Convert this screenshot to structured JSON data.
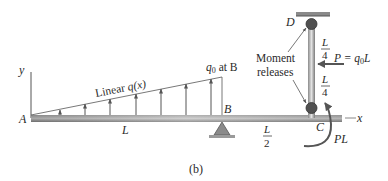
{
  "figure": {
    "caption": "(b)",
    "axes": {
      "y_label": "y",
      "x_label": "x"
    },
    "points": {
      "A": "A",
      "B": "B",
      "C": "C",
      "D": "D"
    },
    "load": {
      "label": "Linear q(x)",
      "label_prefix": "Linear ",
      "label_func": "q(x)",
      "max_label": "q",
      "max_sub": "0",
      "max_suffix": " at B"
    },
    "dimensions": {
      "AB": "L",
      "BC_num": "L",
      "BC_den": "2",
      "CD_upper_num": "L",
      "CD_upper_den": "4",
      "CD_lower_num": "L",
      "CD_lower_den": "4"
    },
    "force": {
      "label": "P = q",
      "sub": "0",
      "suffix": "L"
    },
    "moment": {
      "label": "PL"
    },
    "releases": {
      "line1": "Moment",
      "line2": "releases"
    },
    "colors": {
      "beam_dark": "#6e6e6e",
      "beam_light": "#d8d8d8",
      "arrow": "#555555",
      "hinge": "#505050",
      "support": "#8a8a8a"
    }
  }
}
